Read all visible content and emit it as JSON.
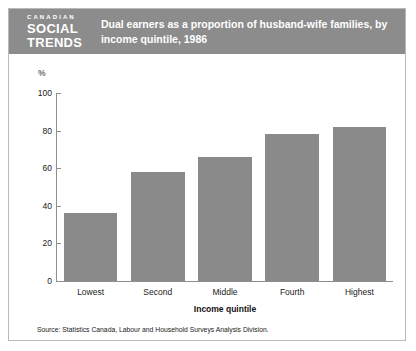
{
  "masthead": {
    "kicker": "CANADIAN",
    "line1": "SOCIAL",
    "line2": "TRENDS"
  },
  "header": {
    "title": "Dual earners as a proportion of husband-wife families, by income quintile, 1986"
  },
  "source": {
    "text": "Source: Statistics Canada, Labour and Household Surveys Analysis Division."
  },
  "colors": {
    "header_band": "#8c8c8c",
    "bar_fill": "#8a8a8a",
    "axis": "#8e8e8e",
    "frame": "#b9b9b9"
  },
  "chart_data": {
    "type": "bar",
    "title": "Dual earners as a proportion of husband-wife families, by income quintile, 1986",
    "subtitle": "",
    "categories": [
      "Lowest",
      "Second",
      "Middle",
      "Fourth",
      "Highest"
    ],
    "values": [
      36,
      58,
      66,
      78,
      82
    ],
    "xlabel": "Income quintile",
    "ylabel": "%",
    "ylim": [
      0,
      100
    ],
    "yticks": [
      0,
      20,
      40,
      60,
      80,
      100
    ],
    "grid": false,
    "legend": null,
    "annotations": []
  }
}
